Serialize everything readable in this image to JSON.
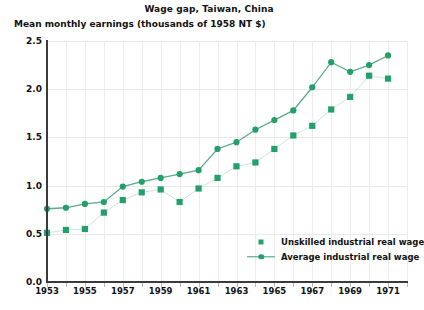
{
  "chart_data": {
    "type": "line",
    "title": "Wage gap, Taiwan, China",
    "subtitle": "Mean monthly earnings (thousands of 1958 NT $)",
    "xlabel": "",
    "ylabel": "",
    "grid": true,
    "legend_position": "inside-bottom-right",
    "accent_color": "#22a06b",
    "line_color": "#3f9b74",
    "x": [
      1953,
      1954,
      1955,
      1956,
      1957,
      1958,
      1959,
      1960,
      1961,
      1962,
      1963,
      1964,
      1965,
      1966,
      1967,
      1968,
      1969,
      1970,
      1971
    ],
    "xlim": [
      1953,
      1972
    ],
    "ylim": [
      0.0,
      2.5
    ],
    "ytick_labels": [
      "0.0",
      "0.5",
      "1.0",
      "1.5",
      "2.0",
      "2.5"
    ],
    "ytick_values": [
      0.0,
      0.5,
      1.0,
      1.5,
      2.0,
      2.5
    ],
    "xtick_labels": [
      "1953",
      "1955",
      "1957",
      "1959",
      "1961",
      "1963",
      "1965",
      "1967",
      "1969",
      "1971"
    ],
    "xtick_values": [
      1953,
      1955,
      1957,
      1959,
      1961,
      1963,
      1965,
      1967,
      1969,
      1971
    ],
    "series": [
      {
        "name": "Unskilled industrial real wage",
        "marker": "square",
        "values": [
          0.51,
          0.54,
          0.55,
          0.72,
          0.85,
          0.93,
          0.96,
          0.83,
          0.97,
          1.08,
          1.2,
          1.24,
          1.38,
          1.52,
          1.62,
          1.79,
          1.92,
          2.14,
          2.11
        ]
      },
      {
        "name": "Average industrial real wage",
        "marker": "circle",
        "values": [
          0.76,
          0.77,
          0.81,
          0.83,
          0.99,
          1.04,
          1.08,
          1.12,
          1.16,
          1.38,
          1.45,
          1.58,
          1.68,
          1.78,
          2.02,
          2.28,
          2.18,
          2.25,
          2.35
        ]
      }
    ]
  },
  "legend": {
    "items": [
      {
        "label": "Unskilled industrial real wage"
      },
      {
        "label": "Average industrial real wage"
      }
    ]
  }
}
